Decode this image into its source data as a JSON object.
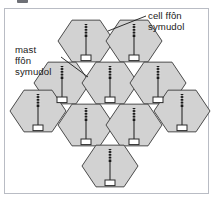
{
  "figure": {
    "kind": "cellular-network-hexagon-diagram",
    "language": "cy",
    "background_color": "#ffffff",
    "frame_border_color": "#b9bcc4"
  },
  "annotations": [
    {
      "id": "cell",
      "name": "cell-label",
      "lines": [
        "cell ffôn",
        "symudol"
      ],
      "text": "cell ffôn symudol",
      "leader_from": [
        146,
        16
      ],
      "leader_to": [
        108,
        31
      ]
    },
    {
      "id": "mast",
      "name": "mast-label",
      "lines": [
        "mast",
        "ffôn",
        "symudol"
      ],
      "text": "mast ffôn symudol",
      "leader_from": [
        61,
        57
      ],
      "leader_to": [
        88,
        77
      ]
    }
  ],
  "cells": {
    "count": 10,
    "fill_color": "#d2d2d2",
    "stroke_color": "#4a4a4a",
    "radius": 28,
    "centers": [
      [
        86,
        41
      ],
      [
        134,
        41
      ],
      [
        62,
        83
      ],
      [
        110,
        83
      ],
      [
        158,
        83
      ],
      [
        38,
        111
      ],
      [
        86,
        125
      ],
      [
        134,
        125
      ],
      [
        182,
        111
      ],
      [
        110,
        166
      ]
    ]
  },
  "mast_symbol": {
    "name": "mobile-phone-mast",
    "pole_color": "#2b2b2b",
    "antenna_color": "#1a1a1a",
    "base_fill": "#ffffff",
    "base_stroke": "#2b2b2b",
    "count_per_cell": 1
  }
}
